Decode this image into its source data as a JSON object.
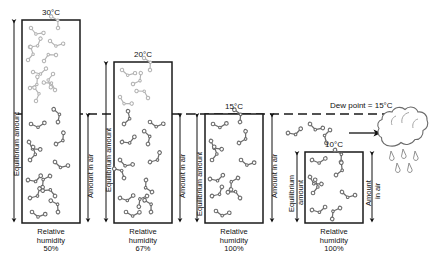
{
  "figure": {
    "title_visible": false,
    "dew_point_label": "Dew point = 15°C",
    "axis_labels": {
      "equilibrium": "Equilibrium amount",
      "equilibrium_line1": "Equilibrium",
      "equilibrium_line2": "amount",
      "amount_in_air": "Amount in air",
      "amount_line1": "Amount",
      "amount_line2": "in air"
    },
    "relative_humidity_label_line1": "Relative",
    "relative_humidity_label_line2": "humidity",
    "colors": {
      "box_stroke": "#1a1a1a",
      "molecule_saturated": "#4a4a4a",
      "molecule_vapor": "#b0b0b0",
      "dashed_line": "#1a1a1a",
      "background": "#ffffff"
    }
  },
  "columns": [
    {
      "id": "col-30c",
      "temperature": "30°C",
      "relative_humidity": "50%",
      "equilibrium_label": "Equilibrium amount",
      "amount_label": "Amount in air",
      "box": {
        "x": 22,
        "y": 20,
        "w": 58,
        "h": 203
      },
      "dewline_y": 114,
      "molecules_above": 11,
      "molecules_below": 11
    },
    {
      "id": "col-20c",
      "temperature": "20°C",
      "relative_humidity": "67%",
      "equilibrium_label": "Equilibrium amount",
      "amount_label": "Amount in air",
      "box": {
        "x": 114,
        "y": 62,
        "w": 58,
        "h": 161
      },
      "dewline_y": 114,
      "molecules_above": 5,
      "molecules_below": 11
    },
    {
      "id": "col-15c",
      "temperature": "15°C",
      "relative_humidity": "100%",
      "equilibrium_label": "Equilibrium amount",
      "amount_label": "Amount in air",
      "box": {
        "x": 205,
        "y": 114,
        "w": 58,
        "h": 109
      },
      "dewline_y": 114,
      "molecules_above": 0,
      "molecules_below": 11
    },
    {
      "id": "col-10c",
      "temperature": "10°C",
      "relative_humidity": "100%",
      "equilibrium_label_line1": "Equilibrium",
      "equilibrium_label_line2": "amount",
      "amount_label_line1": "Amount",
      "amount_label_line2": "in air",
      "box": {
        "x": 305,
        "y": 152,
        "w": 58,
        "h": 71
      },
      "dewline_y": 114,
      "molecules_above": 0,
      "molecules_below": 8
    }
  ],
  "condensation": {
    "arrow": "rightward-arrow",
    "cloud_icon": "cloud-icon",
    "rain_drops": 4,
    "escaped_molecules": 3
  }
}
